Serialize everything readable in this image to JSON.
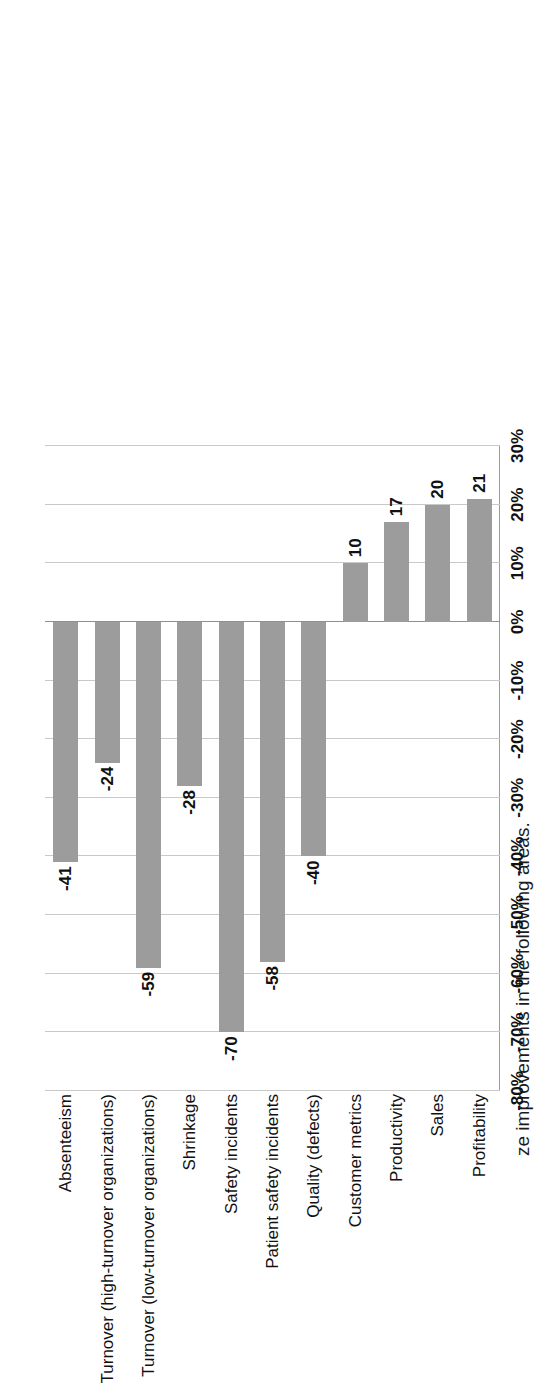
{
  "chart_data": {
    "type": "bar",
    "title": "ze improvements in the following areas.",
    "orientation": "rotated-90ccw",
    "xlabel": "",
    "ylabel": "",
    "grid": true,
    "legend": false,
    "ylim": [
      -80,
      30
    ],
    "tick_labels": [
      "30%",
      "20%",
      "10%",
      "0%",
      "-10%",
      "-20%",
      "-30%",
      "-40%",
      "-50%",
      "-60%",
      "-70%",
      "-80%"
    ],
    "tick_values": [
      30,
      20,
      10,
      0,
      -10,
      -20,
      -30,
      -40,
      -50,
      -60,
      -70,
      -80
    ],
    "categories": [
      "Absenteeism",
      "Turnover (high-turnover organizations)",
      "Turnover (low-turnover organizations)",
      "Shrinkage",
      "Safety incidents",
      "Patient safety incidents",
      "Quality (defects)",
      "Customer metrics",
      "Productivity",
      "Sales",
      "Profitability"
    ],
    "values": [
      -41,
      -24,
      -59,
      -28,
      -70,
      -58,
      -40,
      10,
      17,
      20,
      21
    ],
    "value_labels": [
      "-41",
      "-24",
      "-59",
      "-28",
      "-70",
      "-58",
      "-40",
      "10",
      "17",
      "20",
      "21"
    ],
    "bar_color": "#9c9c9c",
    "gridline_color": "#c9c9c9",
    "axis_color": "#8f8f8f",
    "text_color": "#111111",
    "background": "#ffffff"
  }
}
